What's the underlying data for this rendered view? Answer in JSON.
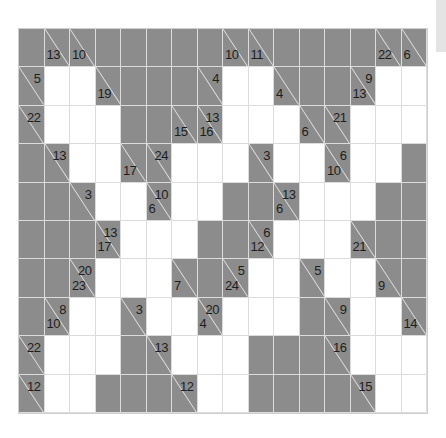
{
  "puzzle": {
    "type": "kakuro",
    "cols": 16,
    "rows": 10,
    "colors": {
      "block": "#8c8c8c",
      "white": "#ffffff",
      "grid_line": "#dcdcdc",
      "text": "#1e1e1e"
    },
    "legend": "Cell codes: B = blocked, W = empty white cell, C = clue cell with optional 'r' (across sum) and 'd' (down sum)",
    "grid": [
      [
        {
          "t": "B"
        },
        {
          "t": "C",
          "d": "13"
        },
        {
          "t": "C",
          "d": "10"
        },
        {
          "t": "B"
        },
        {
          "t": "B"
        },
        {
          "t": "B"
        },
        {
          "t": "B"
        },
        {
          "t": "B"
        },
        {
          "t": "C",
          "d": "10"
        },
        {
          "t": "C",
          "d": "11"
        },
        {
          "t": "B"
        },
        {
          "t": "B"
        },
        {
          "t": "B"
        },
        {
          "t": "B"
        },
        {
          "t": "C",
          "d": "22"
        },
        {
          "t": "C",
          "d": "6"
        }
      ],
      [
        {
          "t": "C",
          "r": "5"
        },
        {
          "t": "W"
        },
        {
          "t": "W"
        },
        {
          "t": "C",
          "d": "19"
        },
        {
          "t": "B"
        },
        {
          "t": "B"
        },
        {
          "t": "B"
        },
        {
          "t": "C",
          "r": "4"
        },
        {
          "t": "W"
        },
        {
          "t": "W"
        },
        {
          "t": "C",
          "d": "4"
        },
        {
          "t": "B"
        },
        {
          "t": "B"
        },
        {
          "t": "C",
          "r": "9",
          "d": "13"
        },
        {
          "t": "W"
        },
        {
          "t": "W"
        }
      ],
      [
        {
          "t": "C",
          "r": "22"
        },
        {
          "t": "W"
        },
        {
          "t": "W"
        },
        {
          "t": "W"
        },
        {
          "t": "B"
        },
        {
          "t": "B"
        },
        {
          "t": "C",
          "d": "15"
        },
        {
          "t": "C",
          "r": "13",
          "d": "16"
        },
        {
          "t": "W"
        },
        {
          "t": "W"
        },
        {
          "t": "W"
        },
        {
          "t": "C",
          "d": "6"
        },
        {
          "t": "C",
          "r": "21"
        },
        {
          "t": "W"
        },
        {
          "t": "W"
        },
        {
          "t": "W"
        }
      ],
      [
        {
          "t": "B"
        },
        {
          "t": "C",
          "r": "13"
        },
        {
          "t": "W"
        },
        {
          "t": "W"
        },
        {
          "t": "C",
          "d": "17"
        },
        {
          "t": "C",
          "r": "24"
        },
        {
          "t": "W"
        },
        {
          "t": "W"
        },
        {
          "t": "W"
        },
        {
          "t": "C",
          "r": "3"
        },
        {
          "t": "W"
        },
        {
          "t": "W"
        },
        {
          "t": "C",
          "r": "6",
          "d": "10"
        },
        {
          "t": "W"
        },
        {
          "t": "W"
        },
        {
          "t": "B"
        }
      ],
      [
        {
          "t": "B"
        },
        {
          "t": "B"
        },
        {
          "t": "C",
          "r": "3"
        },
        {
          "t": "W"
        },
        {
          "t": "W"
        },
        {
          "t": "C",
          "r": "10",
          "d": "6"
        },
        {
          "t": "W"
        },
        {
          "t": "W"
        },
        {
          "t": "B"
        },
        {
          "t": "B"
        },
        {
          "t": "C",
          "r": "13",
          "d": "6"
        },
        {
          "t": "W"
        },
        {
          "t": "W"
        },
        {
          "t": "W"
        },
        {
          "t": "B"
        },
        {
          "t": "B"
        }
      ],
      [
        {
          "t": "B"
        },
        {
          "t": "B"
        },
        {
          "t": "B"
        },
        {
          "t": "C",
          "r": "13",
          "d": "17"
        },
        {
          "t": "W"
        },
        {
          "t": "W"
        },
        {
          "t": "W"
        },
        {
          "t": "B"
        },
        {
          "t": "B"
        },
        {
          "t": "C",
          "r": "6",
          "d": "12"
        },
        {
          "t": "W"
        },
        {
          "t": "W"
        },
        {
          "t": "W"
        },
        {
          "t": "C",
          "d": "21"
        },
        {
          "t": "B"
        },
        {
          "t": "B"
        }
      ],
      [
        {
          "t": "B"
        },
        {
          "t": "B"
        },
        {
          "t": "C",
          "r": "20",
          "d": "23"
        },
        {
          "t": "W"
        },
        {
          "t": "W"
        },
        {
          "t": "W"
        },
        {
          "t": "C",
          "d": "7"
        },
        {
          "t": "B"
        },
        {
          "t": "C",
          "r": "5",
          "d": "24"
        },
        {
          "t": "W"
        },
        {
          "t": "W"
        },
        {
          "t": "C",
          "r": "5"
        },
        {
          "t": "W"
        },
        {
          "t": "W"
        },
        {
          "t": "C",
          "d": "9"
        },
        {
          "t": "B"
        }
      ],
      [
        {
          "t": "B"
        },
        {
          "t": "C",
          "r": "8",
          "d": "10"
        },
        {
          "t": "W"
        },
        {
          "t": "W"
        },
        {
          "t": "C",
          "r": "3"
        },
        {
          "t": "W"
        },
        {
          "t": "W"
        },
        {
          "t": "C",
          "r": "20",
          "d": "4"
        },
        {
          "t": "W"
        },
        {
          "t": "W"
        },
        {
          "t": "W"
        },
        {
          "t": "B"
        },
        {
          "t": "C",
          "r": "9"
        },
        {
          "t": "W"
        },
        {
          "t": "W"
        },
        {
          "t": "C",
          "d": "14"
        }
      ],
      [
        {
          "t": "C",
          "r": "22"
        },
        {
          "t": "W"
        },
        {
          "t": "W"
        },
        {
          "t": "W"
        },
        {
          "t": "B"
        },
        {
          "t": "C",
          "r": "13"
        },
        {
          "t": "W"
        },
        {
          "t": "W"
        },
        {
          "t": "W"
        },
        {
          "t": "B"
        },
        {
          "t": "B"
        },
        {
          "t": "B"
        },
        {
          "t": "C",
          "r": "16"
        },
        {
          "t": "W"
        },
        {
          "t": "W"
        },
        {
          "t": "W"
        }
      ],
      [
        {
          "t": "C",
          "r": "12"
        },
        {
          "t": "W"
        },
        {
          "t": "W"
        },
        {
          "t": "B"
        },
        {
          "t": "B"
        },
        {
          "t": "B"
        },
        {
          "t": "C",
          "r": "12"
        },
        {
          "t": "W"
        },
        {
          "t": "W"
        },
        {
          "t": "B"
        },
        {
          "t": "B"
        },
        {
          "t": "B"
        },
        {
          "t": "B"
        },
        {
          "t": "C",
          "r": "15"
        },
        {
          "t": "W"
        },
        {
          "t": "W"
        }
      ]
    ]
  }
}
